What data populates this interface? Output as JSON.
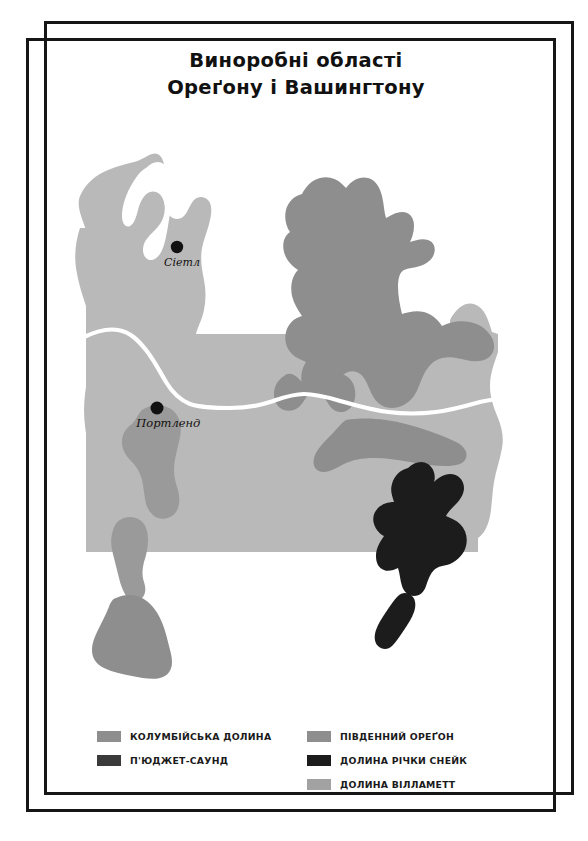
{
  "title": {
    "line1": "Виноробні області",
    "line2": "Ореґону і Вашингтону"
  },
  "colors": {
    "background": "#ffffff",
    "frame": "#161616",
    "land_base": "#b9b9b9",
    "columbia_valley": "#8e8e8e",
    "southern_oregon": "#8e8e8e",
    "willamette_valley": "#9a9a9a",
    "puget_sound": "#3a3a3a",
    "snake_river_valley": "#1c1c1c",
    "river": "#ffffff",
    "city_marker": "#111111",
    "label_text": "#14100e"
  },
  "map": {
    "cities": [
      {
        "name": "Сіетл",
        "x": 131,
        "y": 127
      },
      {
        "name": "Портленд",
        "x": 111,
        "y": 288
      }
    ],
    "river_name": "Columbia River border"
  },
  "legend": {
    "columns": [
      {
        "items": [
          {
            "label": "КОЛУМБІЙСЬКА ДОЛИНА",
            "color": "#8e8e8e",
            "swatch_name": "columbia-valley"
          },
          {
            "label": "П'ЮДЖЕТ-САУНД",
            "color": "#3a3a3a",
            "swatch_name": "puget-sound"
          }
        ]
      },
      {
        "items": [
          {
            "label": "ПІВДЕННИЙ ОРЕҐОН",
            "color": "#8e8e8e",
            "swatch_name": "southern-oregon"
          },
          {
            "label": "ДОЛИНА РІЧКИ СНЕЙК",
            "color": "#1c1c1c",
            "swatch_name": "snake-river-valley"
          },
          {
            "label": "ДОЛИНА ВІЛЛАМЕТТ",
            "color": "#a2a2a2",
            "swatch_name": "willamette-valley"
          }
        ]
      }
    ]
  }
}
